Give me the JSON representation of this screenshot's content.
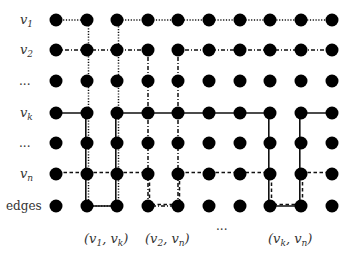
{
  "diagram": {
    "row_labels": [
      {
        "id": "v1",
        "base": "v",
        "sub": "1"
      },
      {
        "id": "v2",
        "base": "v",
        "sub": "2"
      },
      {
        "id": "dots1",
        "text": "..."
      },
      {
        "id": "vk",
        "base": "v",
        "sub": "k"
      },
      {
        "id": "dots2",
        "text": "..."
      },
      {
        "id": "vn",
        "base": "v",
        "sub": "n"
      },
      {
        "id": "edges",
        "text": "edges"
      }
    ],
    "column_labels": [
      {
        "text": "(v1, vk)",
        "parts": [
          "(",
          "v",
          "1",
          ", ",
          "v",
          "k",
          ")"
        ]
      },
      {
        "text": "(v2, vn)",
        "parts": [
          "(",
          "v",
          "2",
          ", ",
          "v",
          "n",
          ")"
        ]
      },
      {
        "text": "..."
      },
      {
        "text": "(vk, vn)",
        "parts": [
          "(",
          "v",
          "k",
          ", ",
          "v",
          "n",
          ")"
        ]
      }
    ],
    "grid": {
      "columns_x": [
        56,
        87,
        117,
        148,
        178,
        209,
        240,
        270,
        301,
        332
      ],
      "rows_y": [
        20,
        50,
        81,
        113,
        143,
        174,
        206
      ],
      "node_radius": 6.5,
      "node_color": "#000000"
    },
    "paths": [
      {
        "name": "path-v1",
        "style": "dotted",
        "points": [
          [
            56,
            20
          ],
          [
            87,
            20
          ],
          [
            87,
            206
          ],
          [
            117,
            206
          ],
          [
            117,
            20
          ],
          [
            332,
            20
          ]
        ]
      },
      {
        "name": "path-v2",
        "style": "dashdot",
        "points": [
          [
            56,
            50
          ],
          [
            148,
            50
          ],
          [
            148,
            206
          ],
          [
            178,
            206
          ],
          [
            178,
            50
          ],
          [
            332,
            50
          ]
        ]
      },
      {
        "name": "path-vk",
        "style": "solid",
        "points": [
          [
            56,
            113
          ],
          [
            87,
            113
          ],
          [
            87,
            206
          ],
          [
            117,
            206
          ],
          [
            117,
            113
          ],
          [
            270,
            113
          ],
          [
            270,
            206
          ],
          [
            301,
            206
          ],
          [
            301,
            113
          ],
          [
            332,
            113
          ]
        ]
      },
      {
        "name": "path-vn",
        "style": "dashed",
        "points": [
          [
            56,
            174
          ],
          [
            148,
            174
          ],
          [
            148,
            206
          ],
          [
            178,
            206
          ],
          [
            178,
            174
          ],
          [
            270,
            174
          ],
          [
            270,
            206
          ],
          [
            301,
            206
          ],
          [
            301,
            174
          ],
          [
            332,
            174
          ]
        ]
      }
    ]
  }
}
